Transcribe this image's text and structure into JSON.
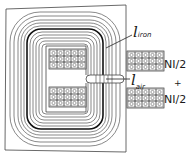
{
  "diagram": {
    "type": "magnetic-circuit-flux-lines",
    "labels": {
      "l_iron": {
        "main": "l",
        "sub": "iron"
      },
      "l_air": {
        "main": "l",
        "sub": "air"
      },
      "coil_top": "NI/2",
      "plus": "+",
      "coil_bottom": "NI/2"
    },
    "coil_grid": {
      "rows": 3,
      "cols": 5
    },
    "colors": {
      "line": "#333333",
      "bold_line": "#111111",
      "background": "#ffffff"
    }
  }
}
